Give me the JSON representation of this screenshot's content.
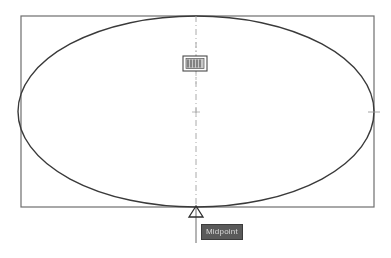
{
  "app": {
    "title": "CAD Drawing Area",
    "background_color": "#ffffff",
    "geometry_color": "#3a3a3a",
    "centerline_color": "#9a9a9a"
  },
  "drawing": {
    "rectangle": {
      "name": "Rectangle",
      "x": 21,
      "y": 16,
      "width": 353,
      "height": 191,
      "stroke": "#6e6e6e",
      "stroke_width": 1.2
    },
    "ellipse": {
      "name": "Ellipse",
      "cx": 196,
      "cy": 111.5,
      "rx": 178,
      "ry": 95.5,
      "stroke": "#3a3a3a",
      "stroke_width": 1.4
    },
    "centerline": {
      "name": "Vertical Centerline",
      "x": 196,
      "y1": 16,
      "y2": 207,
      "stroke": "#a0a0a0",
      "dash_pattern": "6 3 1 3"
    },
    "center_mark": {
      "name": "Center Mark",
      "cx": 196,
      "cy": 112,
      "size": 4,
      "stroke": "#b0b0b0"
    },
    "quadrant_tick_right": {
      "name": "Right Quadrant Tick",
      "cx": 374,
      "cy": 112,
      "size": 6,
      "stroke": "#9a9a9a"
    }
  },
  "cursor": {
    "pickbox": {
      "name": "Pickbox Cursor",
      "x": 183,
      "y": 56,
      "width": 24,
      "height": 15,
      "stroke": "#4a4a4a",
      "fill": "#c8c8c8"
    },
    "crosshair_vertical": {
      "x": 196,
      "y1": 42,
      "y2": 86
    }
  },
  "osnap": {
    "type": "midpoint",
    "marker": {
      "name": "Midpoint Triangle Marker",
      "cx": 196,
      "cy": 207,
      "half_width": 7,
      "height": 11,
      "stroke": "#2e2e2e",
      "fill": "none"
    },
    "leader": {
      "x": 196,
      "y1": 207,
      "y2": 243,
      "stroke": "#6a6a6a"
    },
    "tooltip": {
      "label": "Midpoint",
      "background": "#5a5a5a",
      "text_color": "#d8d8d8",
      "border_color": "#3c3c3c",
      "x": 201,
      "y": 224
    }
  },
  "marker_icons": {
    "midpoint_icon": "triangle-icon",
    "center_icon": "crosshair-icon",
    "pickbox_icon": "pickbox-icon"
  }
}
